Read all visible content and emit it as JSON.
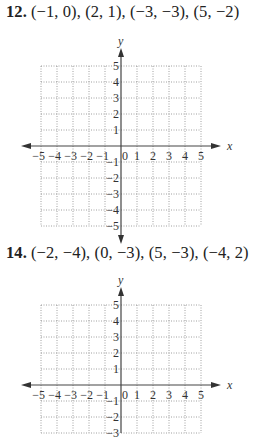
{
  "problems": [
    {
      "number": "12.",
      "points_text": "(−1, 0), (2, 1), (−3, −3), (5, −2)",
      "points": [
        [
          -1,
          0
        ],
        [
          2,
          1
        ],
        [
          -3,
          -3
        ],
        [
          5,
          -2
        ]
      ]
    },
    {
      "number": "14.",
      "points_text": "(−2, −4), (0, −3), (5, −3), (−4, 2)",
      "points": [
        [
          -2,
          -4
        ],
        [
          0,
          -3
        ],
        [
          5,
          -3
        ],
        [
          -4,
          2
        ]
      ]
    }
  ],
  "chart_data": [
    {
      "type": "scatter",
      "title": "12. (−1, 0), (2, 1), (−3, −3), (5, −2)",
      "xlabel": "x",
      "ylabel": "y",
      "xlim": [
        -5,
        5
      ],
      "ylim": [
        -5,
        5
      ],
      "grid": true,
      "x_ticks": [
        "-5",
        "-4",
        "-3",
        "-2",
        "-1",
        "0",
        "1",
        "2",
        "3",
        "4",
        "5"
      ],
      "y_ticks": [
        "5",
        "4",
        "3",
        "2",
        "1",
        "-1",
        "-2",
        "-3",
        "-4",
        "-5"
      ],
      "points_plotted": false,
      "series": [
        {
          "name": "points",
          "x": [
            -1,
            2,
            -3,
            5
          ],
          "y": [
            0,
            1,
            -3,
            -2
          ]
        }
      ]
    },
    {
      "type": "scatter",
      "title": "14. (−2, −4), (0, −3), (5, −3), (−4, 2)",
      "xlabel": "x",
      "ylabel": "y",
      "xlim": [
        -5,
        5
      ],
      "ylim": [
        -5,
        5
      ],
      "grid": true,
      "x_ticks": [
        "-5",
        "-4",
        "-3",
        "-2",
        "-1",
        "0",
        "1",
        "2",
        "3",
        "4",
        "5"
      ],
      "y_ticks": [
        "5",
        "4",
        "3",
        "2",
        "1",
        "-1",
        "-2",
        "-3"
      ],
      "points_plotted": false,
      "series": [
        {
          "name": "points",
          "x": [
            -2,
            0,
            5,
            -4
          ],
          "y": [
            -4,
            -3,
            -3,
            2
          ]
        }
      ]
    }
  ],
  "axes": {
    "x_label": "x",
    "y_label": "y",
    "x_tick_labels": [
      "−5",
      "−4",
      "−3",
      "−2",
      "−1",
      "0",
      "1",
      "2",
      "3",
      "4",
      "5"
    ],
    "y_tick_labels_pos": [
      "5",
      "4",
      "3",
      "2",
      "1"
    ],
    "y_tick_labels_neg": [
      "−1",
      "−2",
      "−3",
      "−4",
      "−5"
    ]
  }
}
